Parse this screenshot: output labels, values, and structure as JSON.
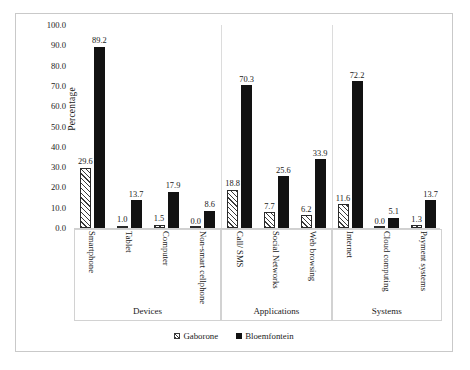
{
  "chart_data": {
    "type": "bar",
    "title": "",
    "xlabel": "",
    "ylabel": "Percentage",
    "ylim": [
      0,
      100
    ],
    "ytick_step": 10,
    "ytick_labels": [
      "0.0",
      "10.0",
      "20.0",
      "30.0",
      "40.0",
      "50.0",
      "60.0",
      "70.0",
      "80.0",
      "90.0",
      "100.0"
    ],
    "grid": false,
    "legend_position": "bottom-center",
    "legend": [
      "Gaborone",
      "Bloemfontein"
    ],
    "categories": [
      "Smartphone",
      "Tablet",
      "Computer",
      "Non-smart cellphone",
      "Call/ SMS",
      "Social Networks",
      "Web browsing",
      "Internet",
      "Cloud computing",
      "Payment systems"
    ],
    "groups": [
      {
        "name": "Devices",
        "categories": [
          "Smartphone",
          "Tablet",
          "Computer",
          "Non-smart cellphone"
        ]
      },
      {
        "name": "Applications",
        "categories": [
          "Call/ SMS",
          "Social Networks",
          "Web browsing"
        ]
      },
      {
        "name": "Systems",
        "categories": [
          "Internet",
          "Cloud computing",
          "Payment systems"
        ]
      }
    ],
    "series": [
      {
        "name": "Gaborone",
        "color": "#ffffff",
        "pattern": "diagonal-hatch",
        "values": [
          29.6,
          1.0,
          1.5,
          0.0,
          18.8,
          7.7,
          6.2,
          11.6,
          0.0,
          1.3
        ]
      },
      {
        "name": "Bloemfontein",
        "color": "#121212",
        "pattern": "solid",
        "values": [
          89.2,
          13.7,
          17.9,
          8.6,
          70.3,
          25.6,
          33.9,
          72.2,
          5.1,
          13.7
        ]
      }
    ],
    "value_labels": [
      "29.6",
      "89.2",
      "1.0",
      "13.7",
      "1.5",
      "17.9",
      "0.0",
      "8.6",
      "18.8",
      "70.3",
      "7.7",
      "25.6",
      "6.2",
      "33.9",
      "11.6",
      "72.2",
      "0.0",
      "5.1",
      "1.3",
      "13.7"
    ]
  },
  "colors": {
    "series_gaborone": "#ffffff",
    "series_bloemfontein": "#121212",
    "axis": "#d0d0d0",
    "frame": "#c9c9c9",
    "text": "#1a1a1a"
  }
}
